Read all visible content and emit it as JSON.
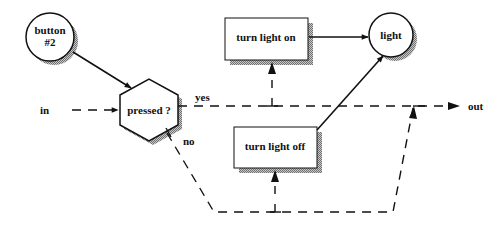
{
  "diagram": {
    "nodes": {
      "button": {
        "line1": "button",
        "line2": "#2",
        "shape": "circle"
      },
      "pressed": {
        "label": "pressed ?",
        "shape": "hexagon"
      },
      "turn_on": {
        "label": "turn light on",
        "shape": "rectangle"
      },
      "turn_off": {
        "label": "turn light off",
        "shape": "rectangle"
      },
      "light": {
        "label": "light",
        "shape": "circle"
      }
    },
    "flow_labels": {
      "in": "in",
      "out": "out",
      "yes": "yes",
      "no": "no"
    },
    "edges": [
      {
        "from": "button",
        "to": "pressed",
        "style": "solid"
      },
      {
        "from": "in",
        "to": "pressed",
        "style": "dashed"
      },
      {
        "from": "pressed",
        "to": "out",
        "style": "dashed",
        "label": "yes"
      },
      {
        "from": "yes-branch",
        "to": "turn_on",
        "style": "dashed"
      },
      {
        "from": "pressed",
        "to": "turn_off",
        "style": "dashed",
        "label": "no"
      },
      {
        "from": "no-branch",
        "to": "out",
        "style": "dashed"
      },
      {
        "from": "turn_on",
        "to": "light",
        "style": "solid"
      },
      {
        "from": "turn_off",
        "to": "light",
        "style": "solid"
      }
    ],
    "colors": {
      "stroke": "#111111",
      "shadow": "#9a9a9a",
      "fill": "#ffffff"
    }
  }
}
